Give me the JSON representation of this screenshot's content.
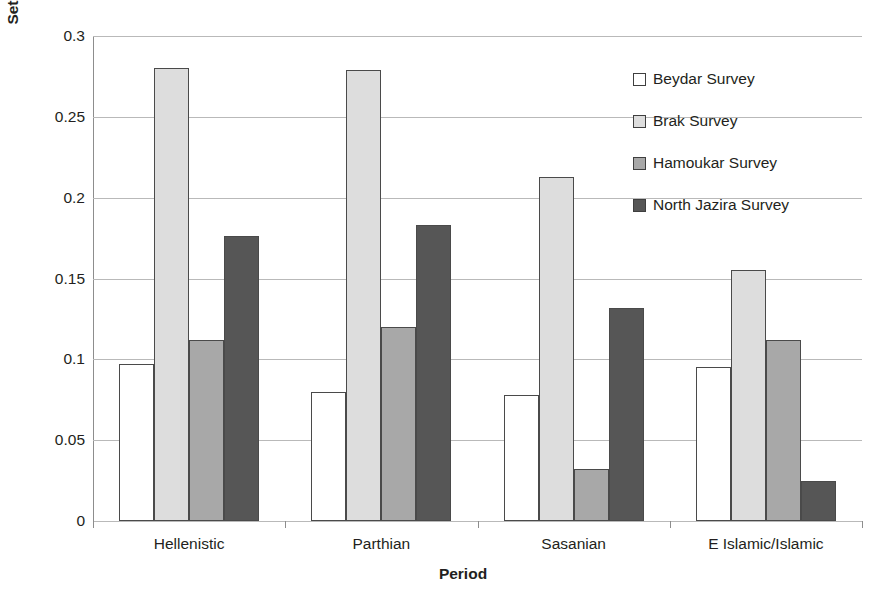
{
  "chart_data": {
    "type": "bar",
    "title": "",
    "xlabel": "Period",
    "ylabel": "Settlement Density (Number Sites/Suvey Area)",
    "categories": [
      "Hellenistic",
      "Parthian",
      "Sasanian",
      "E Islamic/Islamic"
    ],
    "series": [
      {
        "name": "Beydar Survey",
        "color": "#ffffff",
        "values": [
          0.097,
          0.08,
          0.078,
          0.095
        ]
      },
      {
        "name": "Brak Survey",
        "color": "#dddddd",
        "values": [
          0.28,
          0.279,
          0.213,
          0.155
        ]
      },
      {
        "name": "Hamoukar Survey",
        "color": "#a8a8a8",
        "values": [
          0.112,
          0.12,
          0.032,
          0.112
        ]
      },
      {
        "name": "North Jazira Survey",
        "color": "#565656",
        "values": [
          0.176,
          0.183,
          0.132,
          0.025
        ]
      }
    ],
    "ylim": [
      0,
      0.3
    ],
    "y_ticks": [
      0,
      0.05,
      0.1,
      0.15,
      0.2,
      0.25,
      0.3
    ],
    "y_tick_labels": [
      "0",
      "0.05",
      "0.1",
      "0.15",
      "0.2",
      "0.25",
      "0.3"
    ],
    "grid": true,
    "legend_position": "right",
    "bar_border_color": "#4a4a4a"
  }
}
